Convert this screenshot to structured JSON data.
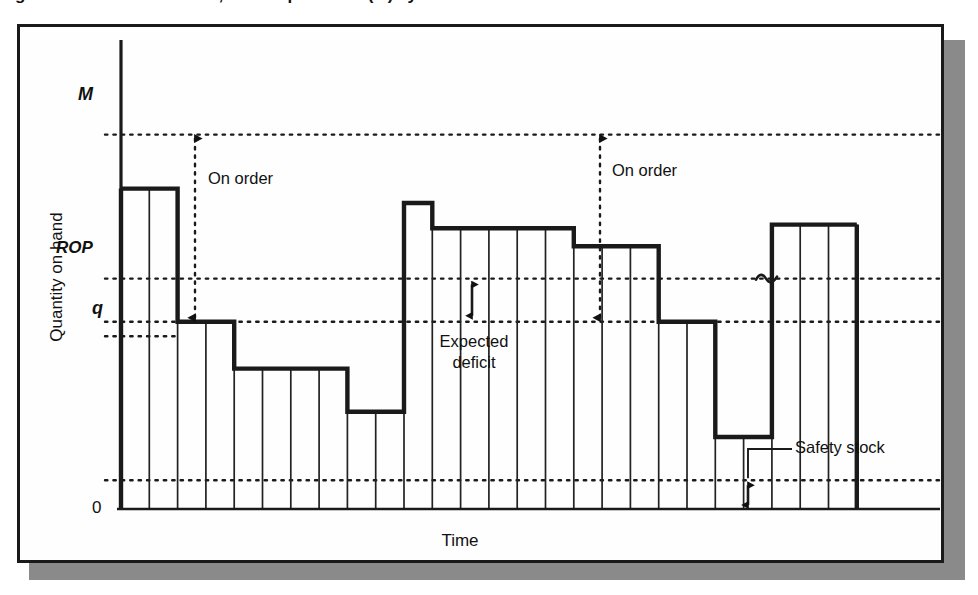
{
  "figure": {
    "caption": "Figure 13.9  Periodic review, order-up-to-level (M) system",
    "title": "",
    "x_axis_title": "Time",
    "y_axis_title": "Quantity on hand"
  },
  "annotations": {
    "on_order_1": "On order",
    "on_order_2": "On order",
    "expected_deficit": "Expected deficit",
    "safety_stock": "Safety stock"
  },
  "colors": {
    "ink": "#1a1a1a",
    "paper": "#fefefe",
    "shadow": "#8a8a8a",
    "step_line": "#111111",
    "thin_line": "#222222"
  },
  "chart_data": {
    "type": "area",
    "xlabel": "Time",
    "ylabel": "Quantity on hand",
    "grid": false,
    "legend": "none",
    "x_tick_labels": [],
    "y_tick_labels": [
      "0",
      "q",
      "ROP",
      "M"
    ],
    "y_tick_values": [
      0,
      52,
      64,
      104
    ],
    "ylim": [
      0,
      115
    ],
    "xlim": [
      0,
      24
    ],
    "reference_lines": [
      {
        "label": "M",
        "value": 104,
        "style": "dotted"
      },
      {
        "label": "ROP",
        "value": 64,
        "style": "dotted"
      },
      {
        "label": "q",
        "value": 52,
        "style": "dotted"
      },
      {
        "label": "q-tick",
        "value": 48,
        "style": "dotted-short"
      },
      {
        "label": "Safety stock level",
        "value": 8,
        "style": "dotted"
      }
    ],
    "step_levels": [
      {
        "bars": 2,
        "level": 89
      },
      {
        "bars": 2,
        "level": 52
      },
      {
        "bars": 4,
        "level": 39
      },
      {
        "bars": 2,
        "level": 27
      },
      {
        "bars": 1,
        "level": 85
      },
      {
        "bars": 5,
        "level": 78
      },
      {
        "bars": 3,
        "level": 73
      },
      {
        "bars": 2,
        "level": 52
      },
      {
        "bars": 2,
        "level": 20
      },
      {
        "bars": 3,
        "level": 79
      }
    ],
    "annotations": [
      {
        "text": "On order",
        "type": "double-arrow-vertical",
        "from": "q",
        "to": "M"
      },
      {
        "text": "On order",
        "type": "double-arrow-vertical",
        "from": "q",
        "to": "M"
      },
      {
        "text": "Expected deficit",
        "type": "double-arrow-vertical",
        "from": "q",
        "to": "ROP"
      },
      {
        "text": "Safety stock",
        "type": "double-arrow-vertical",
        "from": "0",
        "to": "Safety stock level"
      }
    ],
    "break_symbol": "~"
  }
}
